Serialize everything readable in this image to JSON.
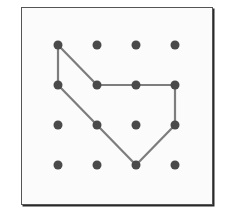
{
  "diagram": {
    "type": "geoboard",
    "grid": {
      "rows": 4,
      "cols": 4
    },
    "dot_x": [
      58,
      97,
      136,
      175
    ],
    "dot_y": [
      45,
      85,
      125,
      165
    ],
    "dot_radius": 4.5,
    "dot_color": "#4a4a4a",
    "line_color": "#7d7d7d",
    "polygon_vertices": [
      [
        0,
        0
      ],
      [
        1,
        1
      ],
      [
        2,
        1
      ],
      [
        3,
        1
      ],
      [
        3,
        2
      ],
      [
        2,
        3
      ],
      [
        1,
        2
      ],
      [
        0,
        1
      ]
    ]
  }
}
